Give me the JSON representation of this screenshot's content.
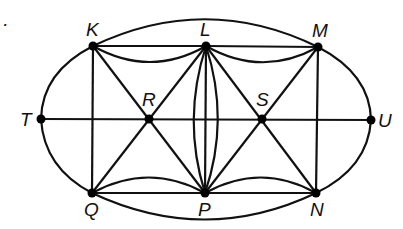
{
  "diagram": {
    "type": "graph",
    "bullet": "·",
    "vertices": [
      {
        "id": "K",
        "label": "K"
      },
      {
        "id": "L",
        "label": "L"
      },
      {
        "id": "M",
        "label": "M"
      },
      {
        "id": "T",
        "label": "T"
      },
      {
        "id": "R",
        "label": "R"
      },
      {
        "id": "S",
        "label": "S"
      },
      {
        "id": "U",
        "label": "U"
      },
      {
        "id": "Q",
        "label": "Q"
      },
      {
        "id": "P",
        "label": "P"
      },
      {
        "id": "N",
        "label": "N"
      }
    ],
    "edges": [
      [
        "K",
        "L"
      ],
      [
        "K",
        "L"
      ],
      [
        "L",
        "M"
      ],
      [
        "L",
        "M"
      ],
      [
        "Q",
        "P"
      ],
      [
        "Q",
        "P"
      ],
      [
        "P",
        "N"
      ],
      [
        "P",
        "N"
      ],
      [
        "K",
        "M"
      ],
      [
        "Q",
        "N"
      ],
      [
        "K",
        "T"
      ],
      [
        "T",
        "Q"
      ],
      [
        "M",
        "U"
      ],
      [
        "U",
        "N"
      ],
      [
        "T",
        "R"
      ],
      [
        "R",
        "S"
      ],
      [
        "S",
        "U"
      ],
      [
        "K",
        "Q"
      ],
      [
        "M",
        "N"
      ],
      [
        "K",
        "R"
      ],
      [
        "R",
        "P"
      ],
      [
        "Q",
        "R"
      ],
      [
        "R",
        "L"
      ],
      [
        "L",
        "S"
      ],
      [
        "S",
        "N"
      ],
      [
        "P",
        "S"
      ],
      [
        "S",
        "M"
      ],
      [
        "L",
        "P"
      ],
      [
        "L",
        "P"
      ],
      [
        "L",
        "P"
      ]
    ]
  }
}
